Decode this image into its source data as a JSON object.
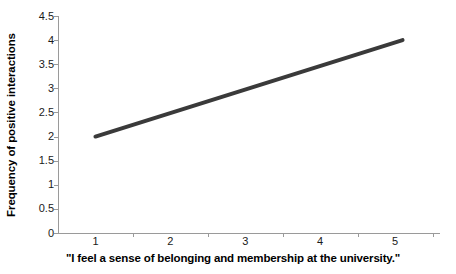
{
  "chart_data": {
    "type": "line",
    "title": "",
    "xlabel": "\"I feel a sense of belonging and membership at the university.\"",
    "ylabel": "Frequency of positive interactions",
    "xlim": [
      0.5,
      5.6
    ],
    "ylim": [
      0,
      4.5
    ],
    "xticks": [
      "1",
      "2",
      "3",
      "4",
      "5"
    ],
    "xtick_values": [
      1,
      2,
      3,
      4,
      5
    ],
    "yticks": [
      "0",
      "0.5",
      "1",
      "1.5",
      "2",
      "2.5",
      "3",
      "3.5",
      "4",
      "4.5"
    ],
    "ytick_values": [
      0,
      0.5,
      1,
      1.5,
      2,
      2.5,
      3,
      3.5,
      4,
      4.5
    ],
    "grid": false,
    "legend": false,
    "legend_position": "none",
    "series": [
      {
        "name": "Frequency of positive interactions",
        "color": "#3a3a3a",
        "line_width": 4,
        "x": [
          1,
          5.1
        ],
        "values": [
          2.0,
          4.0
        ]
      }
    ],
    "axis_color": "#9a9a9a",
    "background": "#ffffff"
  }
}
